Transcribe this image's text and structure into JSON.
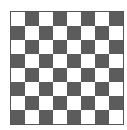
{
  "board": {
    "rows": 8,
    "cols": 8,
    "top_left": "light",
    "colors": {
      "light": "#ffffff",
      "dark": "#5c5c5c",
      "border": "#555555"
    }
  }
}
